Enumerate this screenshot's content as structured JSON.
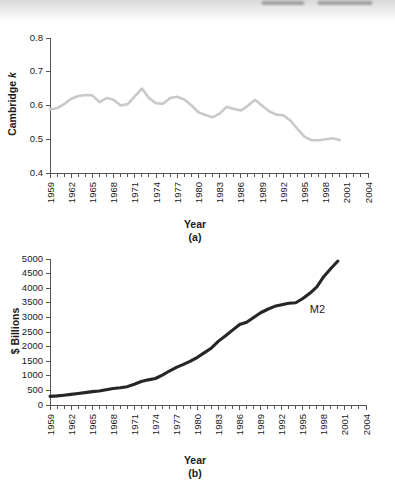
{
  "page": {
    "background_color": "#ffffff",
    "scan_artifact": true
  },
  "figures": [
    {
      "id": "a",
      "caption": "(a)",
      "xlabel": "Year",
      "ylabel_prefix": "Cambridge ",
      "ylabel_italic": "k"
    },
    {
      "id": "b",
      "caption": "(b)",
      "xlabel": "Year",
      "ylabel": "$ Billions"
    }
  ],
  "chart_data": [
    {
      "type": "line",
      "panel": "(a)",
      "title": "",
      "xlabel": "Year",
      "ylabel": "Cambridge k",
      "xlim": [
        1959,
        2004
      ],
      "ylim": [
        0.4,
        0.8
      ],
      "ytick_values": [
        0.4,
        0.5,
        0.6,
        0.7,
        0.8
      ],
      "ytick_labels": [
        "0.4",
        "0.5",
        "0.6",
        "0.7",
        "0.8"
      ],
      "xtick_labels": [
        "1959",
        "1962",
        "1965",
        "1968",
        "1971",
        "1974",
        "1977",
        "1980",
        "1983",
        "1986",
        "1989",
        "1992",
        "1995",
        "1998",
        "2001",
        "2004"
      ],
      "xtick_label_step_years": 3,
      "minor_tick_step_years": 1,
      "grid": false,
      "legend": null,
      "line_color": "#c9c9c9",
      "series": [
        {
          "name": "Cambridge k",
          "x": [
            1959,
            1960,
            1961,
            1962,
            1963,
            1964,
            1965,
            1966,
            1967,
            1968,
            1969,
            1970,
            1971,
            1972,
            1973,
            1974,
            1975,
            1976,
            1977,
            1978,
            1979,
            1980,
            1981,
            1982,
            1983,
            1984,
            1985,
            1986,
            1987,
            1988,
            1989,
            1990,
            1991,
            1992,
            1993,
            1994,
            1995,
            1996,
            1997,
            1998,
            1999,
            2000
          ],
          "values": [
            0.588,
            0.592,
            0.604,
            0.62,
            0.628,
            0.631,
            0.63,
            0.61,
            0.622,
            0.617,
            0.6,
            0.604,
            0.627,
            0.65,
            0.622,
            0.607,
            0.605,
            0.622,
            0.626,
            0.618,
            0.601,
            0.58,
            0.572,
            0.565,
            0.576,
            0.596,
            0.59,
            0.585,
            0.599,
            0.617,
            0.6,
            0.583,
            0.573,
            0.571,
            0.556,
            0.531,
            0.508,
            0.497,
            0.497,
            0.5,
            0.503,
            0.498
          ]
        }
      ]
    },
    {
      "type": "line",
      "panel": "(b)",
      "title": "",
      "xlabel": "Year",
      "ylabel": "$ Billions",
      "xlim": [
        1959,
        2004
      ],
      "ylim": [
        0,
        5000
      ],
      "ytick_values": [
        0,
        500,
        1000,
        1500,
        2000,
        2500,
        3000,
        3500,
        4000,
        4500,
        5000
      ],
      "ytick_labels": [
        "0",
        "500",
        "1000",
        "1500",
        "2000",
        "2500",
        "3000",
        "3500",
        "4000",
        "4500",
        "5000"
      ],
      "xtick_labels": [
        "1959",
        "1962",
        "1965",
        "1968",
        "1971",
        "1974",
        "1977",
        "1980",
        "1983",
        "1986",
        "1989",
        "1992",
        "1995",
        "1998",
        "2001",
        "2004"
      ],
      "xtick_label_step_years": 3,
      "minor_tick_step_years": 1,
      "grid": false,
      "annotations": [
        {
          "text": "M2",
          "x": 1996,
          "y": 3150
        }
      ],
      "line_color": "#262626",
      "series": [
        {
          "name": "M2",
          "x": [
            1959,
            1960,
            1961,
            1962,
            1963,
            1964,
            1965,
            1966,
            1967,
            1968,
            1969,
            1970,
            1971,
            1972,
            1973,
            1974,
            1975,
            1976,
            1977,
            1978,
            1979,
            1980,
            1981,
            1982,
            1983,
            1984,
            1985,
            1986,
            1987,
            1988,
            1989,
            1990,
            1991,
            1992,
            1993,
            1994,
            1995,
            1996,
            1997,
            1998,
            1999,
            2000
          ],
          "values": [
            297,
            312,
            336,
            363,
            393,
            425,
            459,
            480,
            525,
            567,
            589,
            628,
            713,
            806,
            861,
            908,
            1023,
            1164,
            1287,
            1389,
            1500,
            1633,
            1795,
            1954,
            2188,
            2371,
            2563,
            2755,
            2832,
            2996,
            3159,
            3279,
            3379,
            3434,
            3487,
            3502,
            3649,
            3824,
            4046,
            4402,
            4674,
            4930
          ]
        }
      ]
    }
  ]
}
